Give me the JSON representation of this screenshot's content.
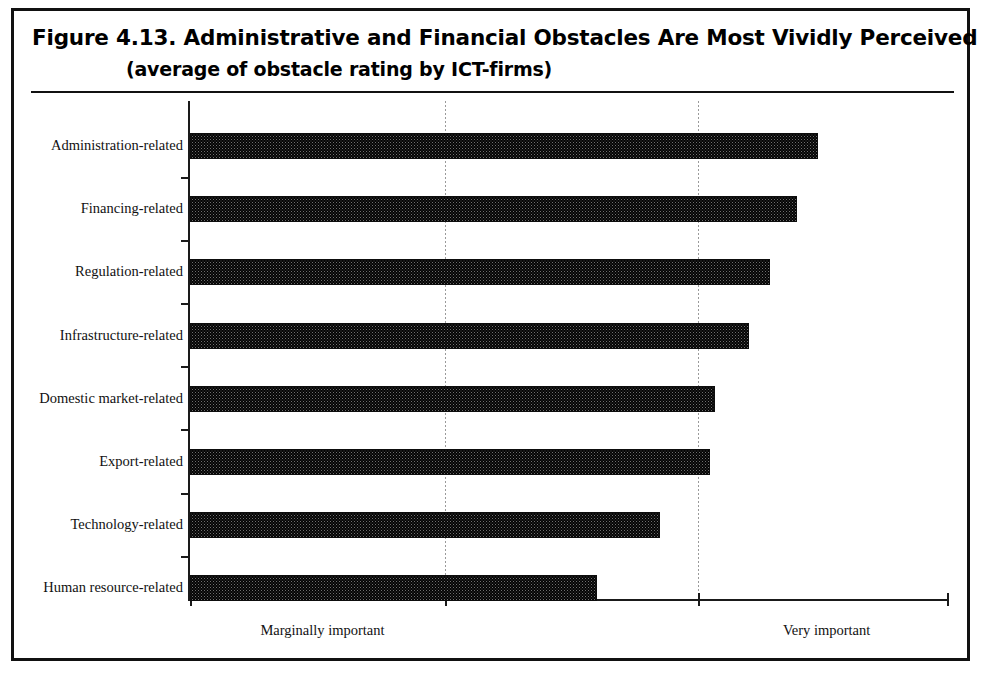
{
  "figure": {
    "title": "Figure 4.13.  Administrative and Financial Obstacles Are Most Vividly Perceived",
    "subtitle": "(average of obstacle rating by ICT-firms)"
  },
  "axis": {
    "x_low_label": "Marginally important",
    "x_high_label": "Very important"
  },
  "chart_data": {
    "type": "bar",
    "orientation": "horizontal",
    "title": "Figure 4.13.  Administrative and Financial Obstacles Are Most Vividly Perceived",
    "subtitle": "(average of obstacle rating by ICT-firms)",
    "xlabel": "",
    "ylabel": "",
    "categories": [
      "Administration-related",
      "Financing-related",
      "Regulation-related",
      "Infrastructure-related",
      "Domestic market-related",
      "Export-related",
      "Technology-related",
      "Human resource-related"
    ],
    "values": [
      0.829,
      0.802,
      0.766,
      0.738,
      0.693,
      0.687,
      0.621,
      0.538
    ],
    "xlim": [
      0,
      1
    ],
    "xticks": [
      0,
      0.337,
      0.671,
      1
    ],
    "xtick_labels": [
      "Marginally important",
      "",
      "Very important",
      ""
    ],
    "grid": true,
    "gridlines_x": [
      0.337,
      0.671
    ],
    "legend": "none",
    "series": [
      {
        "name": "average obstacle rating",
        "values": [
          0.829,
          0.802,
          0.766,
          0.738,
          0.693,
          0.687,
          0.621,
          0.538
        ]
      }
    ]
  },
  "style": {
    "bar_fill": "#6f6f6f",
    "bar_border": "#0d0d0d",
    "axis_color": "#1a1a1a",
    "frame_color": "#111111",
    "background": "#ffffff"
  }
}
